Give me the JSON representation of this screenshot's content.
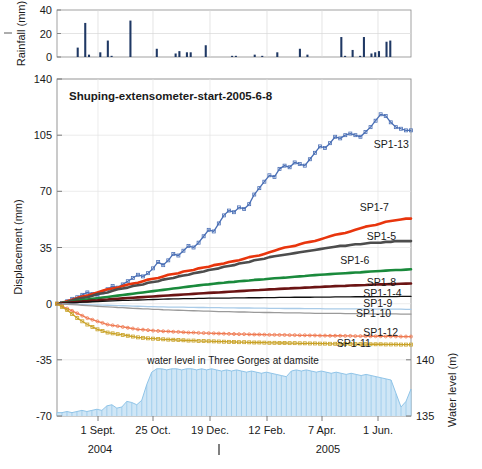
{
  "figure": {
    "title": "Shuping-extensometer-start-2005-6-8",
    "water_annotation": "water level in Three Gorges at damsite"
  },
  "axes": {
    "rainfall": {
      "label": "Rainfall (mm)",
      "ticks": [
        "0",
        "20",
        "40"
      ],
      "ylim": [
        0,
        40
      ]
    },
    "displacement": {
      "label": "Displacement (mm)",
      "ticks": [
        "-70",
        "-35",
        "0",
        "35",
        "70",
        "105",
        "140"
      ],
      "ylim": [
        -70,
        140
      ]
    },
    "waterlevel": {
      "label": "Water level (m)",
      "ticks": [
        "135",
        "140"
      ],
      "ylim": [
        135,
        140
      ]
    },
    "x": {
      "ticks": [
        "1 Sept.",
        "25 Oct.",
        "19 Dec.",
        "12 Feb.",
        "7 Apr.",
        "1 Jun."
      ],
      "years": [
        "2004",
        "2005"
      ]
    }
  },
  "colors": {
    "rainfall_bar": "#1f3864",
    "waterlevel": "#8fc4e8",
    "sp1_13": "#4a6fb5",
    "sp1_7": "#e8350d",
    "sp1_5": "#4d4d4d",
    "sp1_6": "#1a8a3c",
    "sp1_8": "#6b1414",
    "sp1_1_4": "#111111",
    "sp1_9": "#a9cbe8",
    "sp1_10": "#9a9a9a",
    "sp1_12": "#ef7a52",
    "sp1_11": "#c9a227",
    "grid": "#e2e2e2",
    "axis": "#6e6e6e"
  },
  "chart_data": {
    "type": "line",
    "title": "Shuping-extensometer-start-2005-6-8",
    "xlabel": "",
    "ylabel": "Displacement (mm)",
    "ylim": [
      -70,
      140
    ],
    "y2label": "Water level (m)",
    "y2lim": [
      135,
      140
    ],
    "grid": true,
    "legend": "inline-right-of-curve",
    "x_tick_labels": [
      "1 Sept.",
      "25 Oct.",
      "19 Dec.",
      "12 Feb.",
      "7 Apr.",
      "1 Jun."
    ],
    "x_tick_positions": [
      0.115,
      0.27,
      0.43,
      0.59,
      0.745,
      0.9
    ],
    "x_domain_note": "2004-08-01 to 2005-07-01 approx",
    "series": [
      {
        "name": "SP1-13",
        "color": "#4a6fb5",
        "marker": "square-open",
        "label_xy": [
          0.895,
          97
        ],
        "values": [
          0,
          0.5,
          1.5,
          3,
          4,
          5.5,
          7,
          6,
          5,
          7,
          9,
          11,
          10,
          12,
          14,
          16,
          18,
          17,
          19,
          22,
          26,
          24,
          27,
          31,
          30,
          33,
          36,
          35,
          38,
          42,
          46,
          45,
          50,
          55,
          58,
          57,
          60,
          59,
          62,
          68,
          72,
          76,
          80,
          79,
          84,
          86,
          85,
          88,
          87,
          86,
          90,
          94,
          98,
          97,
          100,
          104,
          103,
          105,
          106,
          105,
          104,
          107,
          110,
          114,
          118,
          117,
          113,
          110,
          109,
          108,
          108
        ]
      },
      {
        "name": "SP1-7",
        "color": "#e8350d",
        "marker": "none",
        "label_xy": [
          0.855,
          58
        ],
        "values": [
          0,
          0.5,
          1.5,
          2.5,
          3.5,
          4.5,
          5,
          6,
          7,
          8,
          9,
          9.5,
          10,
          11,
          12,
          12.5,
          13,
          14,
          15,
          15.5,
          16,
          17,
          18,
          18.5,
          19,
          20,
          20.5,
          21,
          22,
          22.5,
          23,
          24,
          24.5,
          25,
          26,
          26.5,
          27,
          28,
          29,
          29.5,
          30,
          31,
          32,
          33,
          34,
          35,
          35.5,
          36,
          37,
          38,
          38.5,
          39,
          40,
          41,
          42,
          43,
          43.5,
          44,
          45,
          46,
          47,
          48,
          48.5,
          49,
          50,
          51,
          51.5,
          52,
          52.5,
          53,
          53
        ]
      },
      {
        "name": "SP1-5",
        "color": "#4d4d4d",
        "marker": "none",
        "label_xy": [
          0.875,
          40
        ],
        "values": [
          0,
          0.5,
          1,
          2,
          3,
          3.5,
          4,
          5,
          6,
          6.5,
          7,
          8,
          9,
          9.5,
          10,
          11,
          11.5,
          12,
          13,
          13.5,
          14,
          15,
          15.5,
          16,
          17,
          17.5,
          18,
          19,
          19.5,
          20,
          21,
          21.5,
          22,
          23,
          23.5,
          24,
          25,
          25.5,
          26,
          27,
          27.5,
          28,
          29,
          29.5,
          30,
          30.5,
          31,
          31.5,
          32,
          32.5,
          33,
          33.5,
          34,
          34.5,
          35,
          35.5,
          36,
          36,
          36.5,
          37,
          37,
          37.5,
          38,
          38,
          38,
          38.5,
          38.5,
          39,
          39,
          39,
          39
        ]
      },
      {
        "name": "SP1-6",
        "color": "#1a8a3c",
        "marker": "none",
        "label_xy": [
          0.8,
          25
        ],
        "values": [
          0,
          0.4,
          0.8,
          1.2,
          1.8,
          2.2,
          2.6,
          3,
          3.4,
          3.8,
          4.2,
          4.6,
          5,
          5.4,
          5.8,
          6.2,
          6.6,
          7,
          7.4,
          7.8,
          8.2,
          8.6,
          9,
          9.4,
          9.8,
          10.2,
          10.6,
          11,
          11.4,
          11.8,
          12,
          12.4,
          12.8,
          13,
          13.4,
          13.6,
          14,
          14.2,
          14.4,
          14.8,
          15,
          15.2,
          15.5,
          15.8,
          16,
          16.2,
          16.5,
          16.8,
          17,
          17.2,
          17.5,
          17.8,
          18,
          18.2,
          18.4,
          18.6,
          18.8,
          19,
          19.2,
          19.4,
          19.5,
          19.8,
          20,
          20.2,
          20.4,
          20.6,
          20.8,
          21,
          21,
          21.2,
          21.4
        ]
      },
      {
        "name": "SP1-8",
        "color": "#6b1414",
        "marker": "none",
        "label_xy": [
          0.875,
          11
        ],
        "values": [
          0,
          0.2,
          0.5,
          0.8,
          1.1,
          1.4,
          1.6,
          1.9,
          2.1,
          2.4,
          2.6,
          2.9,
          3.1,
          3.3,
          3.5,
          3.7,
          3.9,
          4.1,
          4.3,
          4.5,
          4.7,
          4.9,
          5.1,
          5.3,
          5.5,
          5.7,
          5.9,
          6.1,
          6.3,
          6.5,
          6.7,
          6.9,
          7,
          7.2,
          7.4,
          7.6,
          7.8,
          8,
          8.2,
          8.4,
          8.5,
          8.7,
          8.9,
          9,
          9.2,
          9.4,
          9.5,
          9.7,
          9.8,
          10,
          10.1,
          10.3,
          10.4,
          10.6,
          10.7,
          10.9,
          11,
          11.1,
          11.3,
          11.4,
          11.5,
          11.6,
          11.8,
          11.9,
          12,
          12.1,
          12.2,
          12.3,
          12.4,
          12.5,
          12.6
        ]
      },
      {
        "name": "SP1-1-4",
        "color": "#111111",
        "marker": "none",
        "label_xy": [
          0.865,
          4
        ],
        "values": [
          0,
          0.1,
          0.3,
          0.5,
          0.7,
          0.9,
          1,
          1.2,
          1.3,
          1.5,
          1.6,
          1.8,
          1.9,
          2,
          2.1,
          2.2,
          2.3,
          2.4,
          2.5,
          2.6,
          2.7,
          2.8,
          2.9,
          3,
          3,
          3.1,
          3.2,
          3.2,
          3.3,
          3.3,
          3.4,
          3.4,
          3.5,
          3.5,
          3.5,
          3.6,
          3.6,
          3.6,
          3.7,
          3.7,
          3.7,
          3.8,
          3.8,
          3.8,
          3.9,
          3.9,
          3.9,
          4,
          4,
          4,
          4,
          4.1,
          4.1,
          4.1,
          4.1,
          4.2,
          4.2,
          4.2,
          4.2,
          4.3,
          4.3,
          4.3,
          4.3,
          4.4,
          4.4,
          4.4,
          4.4,
          4.4,
          4.5,
          4.5,
          4.5
        ]
      },
      {
        "name": "SP1-9",
        "color": "#a9cbe8",
        "marker": "none",
        "label_xy": [
          0.865,
          -2
        ],
        "values": [
          0,
          -0.1,
          -0.2,
          -0.3,
          -0.4,
          -0.5,
          -0.6,
          -0.7,
          -0.8,
          -0.9,
          -1,
          -1.1,
          -1.2,
          -1.3,
          -1.4,
          -1.5,
          -1.6,
          -1.7,
          -1.8,
          -1.9,
          -2,
          -2,
          -2.1,
          -2.1,
          -2.2,
          -2.2,
          -2.3,
          -2.3,
          -2.4,
          -2.4,
          -2.5,
          -2.5,
          -2.5,
          -2.6,
          -2.6,
          -2.6,
          -2.7,
          -2.7,
          -2.7,
          -2.8,
          -2.8,
          -2.8,
          -2.9,
          -2.9,
          -2.9,
          -3,
          -3,
          -3,
          -3,
          -3.1,
          -3.1,
          -3.1,
          -3.1,
          -3.2,
          -3.2,
          -3.2,
          -3.2,
          -3.2,
          -3.3,
          -3.3,
          -3.3,
          -3.3,
          -3.3,
          -3.4,
          -3.4,
          -3.4,
          -3.4,
          -3.4,
          -3.4,
          -3.5,
          -3.5
        ]
      },
      {
        "name": "SP1-10",
        "color": "#9a9a9a",
        "marker": "none",
        "label_xy": [
          0.845,
          -8
        ],
        "values": [
          0,
          -0.2,
          -0.4,
          -0.6,
          -0.8,
          -1,
          -1.2,
          -1.4,
          -1.6,
          -1.8,
          -2,
          -2.2,
          -2.4,
          -2.5,
          -2.7,
          -2.9,
          -3,
          -3.2,
          -3.3,
          -3.5,
          -3.6,
          -3.8,
          -3.9,
          -4,
          -4.1,
          -4.2,
          -4.3,
          -4.4,
          -4.5,
          -4.6,
          -4.7,
          -4.8,
          -4.9,
          -5,
          -5,
          -5.1,
          -5.2,
          -5.2,
          -5.3,
          -5.4,
          -5.4,
          -5.5,
          -5.5,
          -5.6,
          -5.6,
          -5.7,
          -5.7,
          -5.8,
          -5.8,
          -5.9,
          -5.9,
          -6,
          -6,
          -6,
          -6.1,
          -6.1,
          -6.1,
          -6.2,
          -6.2,
          -6.2,
          -6.3,
          -6.3,
          -6.3,
          -6.3,
          -6.4,
          -6.4,
          -6.4,
          -6.4,
          -6.5,
          -6.5,
          -6.5
        ]
      },
      {
        "name": "SP1-12",
        "color": "#ef7a52",
        "marker": "circle-open",
        "label_xy": [
          0.865,
          -20
        ],
        "values": [
          0,
          -1.5,
          -3,
          -4.5,
          -6,
          -7.5,
          -9,
          -10,
          -11,
          -12,
          -13,
          -13.5,
          -14,
          -14.5,
          -15,
          -15.5,
          -16,
          -16.2,
          -16.5,
          -16.8,
          -17,
          -17.2,
          -17.3,
          -17.5,
          -17.6,
          -17.8,
          -18,
          -18,
          -18.2,
          -18.3,
          -18.4,
          -18.5,
          -18.6,
          -18.7,
          -18.8,
          -18.9,
          -19,
          -19,
          -19.1,
          -19.2,
          -19.2,
          -19.3,
          -19.4,
          -19.4,
          -19.5,
          -19.5,
          -19.6,
          -19.6,
          -19.7,
          -19.7,
          -19.8,
          -19.8,
          -19.9,
          -19.9,
          -20,
          -20,
          -20,
          -20.1,
          -20.1,
          -20.2,
          -20.2,
          -20.2,
          -20.3,
          -20.3,
          -20.3,
          -20.4,
          -20.4,
          -20.4,
          -20.5,
          -20.5,
          -20.5
        ]
      },
      {
        "name": "SP1-11",
        "color": "#c9a227",
        "marker": "square-open",
        "label_xy": [
          0.79,
          -27
        ],
        "values": [
          0,
          -2,
          -4,
          -6.5,
          -9,
          -11,
          -13,
          -14.5,
          -16,
          -17,
          -18,
          -18.5,
          -19,
          -19.5,
          -20,
          -20.5,
          -21,
          -21.3,
          -21.6,
          -21.8,
          -22,
          -22.2,
          -22.4,
          -22.5,
          -22.7,
          -22.8,
          -23,
          -23,
          -23.2,
          -23.3,
          -23.4,
          -23.5,
          -23.6,
          -23.7,
          -23.8,
          -23.9,
          -24,
          -24,
          -24.1,
          -24.2,
          -24.2,
          -24.3,
          -24.4,
          -24.4,
          -24.5,
          -24.5,
          -24.6,
          -24.6,
          -24.7,
          -24.7,
          -24.8,
          -24.8,
          -24.9,
          -24.9,
          -25,
          -25,
          -25,
          -25.1,
          -25.1,
          -25.2,
          -25.2,
          -25.2,
          -25.3,
          -25.3,
          -25.3,
          -25.4,
          -25.4,
          -25.4,
          -25.5,
          -25.5,
          -25.5
        ]
      }
    ],
    "waterlevel_series": {
      "name": "water level in Three Gorges at damsite",
      "color": "#8fc4e8",
      "unit": "m",
      "values": [
        135.3,
        135.3,
        135.4,
        135.3,
        135.4,
        135.5,
        135.4,
        135.5,
        135.6,
        135.5,
        135.9,
        136.0,
        135.7,
        135.8,
        136.3,
        136.2,
        136.0,
        136.4,
        137.8,
        138.9,
        139.2,
        139.2,
        139.1,
        139.2,
        139.2,
        139.1,
        139.2,
        139.2,
        139.1,
        139.2,
        139.1,
        139.2,
        139.1,
        139.0,
        139.1,
        139.0,
        139.1,
        139.0,
        138.9,
        139.0,
        138.9,
        138.8,
        138.9,
        138.8,
        138.7,
        138.6,
        138.5,
        139.0,
        139.1,
        139.0,
        139.1,
        139.0,
        138.9,
        139.0,
        138.9,
        138.8,
        138.9,
        138.8,
        138.7,
        138.8,
        138.7,
        138.6,
        138.7,
        138.6,
        138.5,
        138.4,
        138.3,
        138.2,
        137.0,
        135.8,
        136.3,
        137.4
      ]
    },
    "rainfall_series": {
      "name": "Rainfall (mm)",
      "color": "#1f3864",
      "unit": "mm",
      "ylim": [
        0,
        40
      ],
      "values": [
        0,
        0,
        0,
        0,
        0,
        8,
        0,
        29,
        2,
        0,
        0,
        4,
        0,
        14,
        1,
        0,
        0,
        0,
        0,
        31,
        0,
        0,
        0,
        0,
        0,
        0,
        7,
        0,
        0,
        0,
        0,
        3,
        5,
        0,
        4,
        4,
        0,
        0,
        0,
        10,
        0,
        0,
        0,
        0,
        0,
        0,
        1,
        1,
        0,
        0,
        0,
        0,
        2,
        0,
        1,
        0,
        0,
        0,
        4,
        0,
        0,
        0,
        0,
        0,
        7,
        0,
        2,
        0,
        0,
        0,
        0,
        0,
        0,
        0,
        0,
        17,
        1,
        0,
        6,
        0,
        1,
        17,
        0,
        3,
        4,
        5,
        0,
        13,
        14,
        0,
        0,
        0,
        0,
        0
      ]
    }
  }
}
